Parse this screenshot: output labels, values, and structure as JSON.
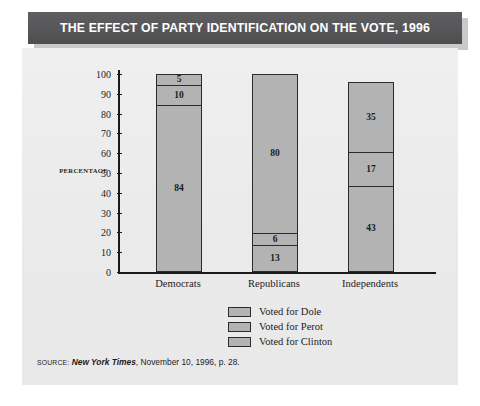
{
  "title": "THE EFFECT OF PARTY IDENTIFICATION ON THE VOTE, 1996",
  "axis_title": "PERCENTAGE",
  "source": {
    "keyword": "SOURCE:",
    "publication": "New York Times",
    "rest": ", November 10, 1996, p. 28."
  },
  "colors": {
    "banner": "#58585a",
    "banner_text": "#ffffff",
    "panel": "#ededed",
    "bar_fill": "#b3b3b3",
    "bar_stroke": "#2b2b2b",
    "axis": "#1a1a1a",
    "text": "#1c1c1c"
  },
  "chart_data": {
    "type": "bar",
    "subtype": "stacked-vertical",
    "title": "THE EFFECT OF PARTY IDENTIFICATION ON THE VOTE, 1996",
    "xlabel": "",
    "ylabel": "PERCENTAGE",
    "ylim": [
      0,
      100
    ],
    "yticks": [
      0,
      10,
      20,
      30,
      40,
      50,
      60,
      70,
      80,
      90,
      100
    ],
    "ytick_labels": [
      "0",
      "10",
      "20",
      "30",
      "40",
      "50",
      "60",
      "70",
      "80",
      "90",
      "100"
    ],
    "grid": false,
    "legend_position": "bottom-center",
    "categories": [
      "Democrats",
      "Republicans",
      "Independents"
    ],
    "series": [
      {
        "name": "Voted for Clinton",
        "values": [
          84,
          13,
          43
        ],
        "color": "#b3b3b3"
      },
      {
        "name": "Voted for Perot",
        "values": [
          10,
          6,
          17
        ],
        "color": "#b3b3b3"
      },
      {
        "name": "Voted for Dole",
        "values": [
          5,
          80,
          35
        ],
        "color": "#b3b3b3"
      }
    ],
    "stack_order_bottom_to_top": [
      "Voted for Clinton",
      "Voted for Perot",
      "Voted for Dole"
    ],
    "totals": [
      99,
      99,
      95
    ],
    "bars": [
      {
        "category": "Democrats",
        "total": 99,
        "segments_top_to_bottom": [
          {
            "label": "5",
            "value": 5,
            "series": "Voted for Dole"
          },
          {
            "label": "10",
            "value": 10,
            "series": "Voted for Perot"
          },
          {
            "label": "84",
            "value": 84,
            "series": "Voted for Clinton"
          }
        ]
      },
      {
        "category": "Republicans",
        "total": 99,
        "segments_top_to_bottom": [
          {
            "label": "80",
            "value": 80,
            "series": "Voted for Dole"
          },
          {
            "label": "6",
            "value": 6,
            "series": "Voted for Perot"
          },
          {
            "label": "13",
            "value": 13,
            "series": "Voted for Clinton"
          }
        ]
      },
      {
        "category": "Independents",
        "total": 95,
        "segments_top_to_bottom": [
          {
            "label": "35",
            "value": 35,
            "series": "Voted for Dole"
          },
          {
            "label": "17",
            "value": 17,
            "series": "Voted for Perot"
          },
          {
            "label": "43",
            "value": 43,
            "series": "Voted for Clinton"
          }
        ]
      }
    ],
    "legend": [
      {
        "label": "Voted for Dole"
      },
      {
        "label": "Voted for Perot"
      },
      {
        "label": "Voted for Clinton"
      }
    ]
  }
}
